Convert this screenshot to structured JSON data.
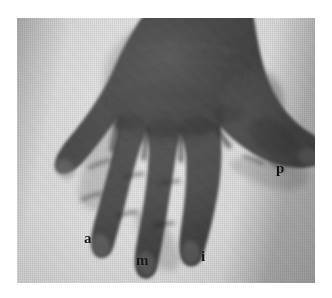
{
  "figure": {
    "kind": "clinical-photograph",
    "color_mode": "grayscale",
    "page_background": "#ffffff",
    "plate": {
      "background_color": "#d8d8d6",
      "skin_color": "#3d3d3b",
      "skin_shadow_color": "#262625",
      "skin_highlight_color": "#6a6a66",
      "left": 17,
      "top": 18,
      "width": 298,
      "height": 265
    }
  },
  "labels": [
    {
      "id": "a",
      "text": "a",
      "meaning": "annularis (ring finger)",
      "x": 88,
      "y": 240
    },
    {
      "id": "m",
      "text": "m",
      "meaning": "medius (middle finger)",
      "x": 140,
      "y": 262
    },
    {
      "id": "i",
      "text": "i",
      "meaning": "index finger",
      "x": 205,
      "y": 258
    },
    {
      "id": "p",
      "text": "p",
      "meaning": "pollex (thumb)",
      "x": 280,
      "y": 170
    }
  ]
}
